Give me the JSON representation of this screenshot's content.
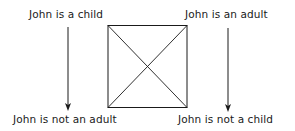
{
  "diagram": {
    "type": "square-of-opposition",
    "corners": {
      "top_left": "John is a child",
      "top_right": "John is an adult",
      "bottom_left": "John is not an adult",
      "bottom_right": "John is not a child"
    },
    "arrows": [
      {
        "from": "top_left",
        "to": "bottom_left"
      },
      {
        "from": "top_right",
        "to": "bottom_right"
      }
    ],
    "colors": {
      "ink": "#1a1a1a",
      "background": "#ffffff"
    }
  }
}
